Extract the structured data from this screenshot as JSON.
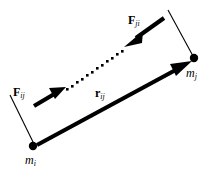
{
  "figure": {
    "background_color": "#ffffff",
    "stroke_color": "#000000",
    "width": 212,
    "height": 171,
    "labels": {
      "force_ji": {
        "base": "F",
        "subscript": "ji",
        "bold": true,
        "italic_subscript": true
      },
      "force_ij": {
        "base": "F",
        "subscript": "ij",
        "bold": true,
        "italic_subscript": true
      },
      "separation_r": {
        "base": "r",
        "subscript": "ij",
        "bold": true,
        "italic_subscript": true
      },
      "mass_j": {
        "base": "m",
        "subscript": "j",
        "bold": false,
        "italic_subscript": true
      },
      "mass_i": {
        "base": "m",
        "subscript": "i",
        "bold": false,
        "italic_subscript": true
      }
    },
    "geometry": {
      "point_mass_i": {
        "x": 33,
        "y": 146,
        "radius": 4
      },
      "point_mass_j": {
        "x": 194,
        "y": 58,
        "radius": 4
      },
      "vector_r_ij": {
        "from_x": 36,
        "from_y": 146,
        "to_x": 190,
        "to_y": 62,
        "style": "solid-thick-arrow"
      },
      "vector_F_ij": {
        "from_x": 33,
        "from_y": 105,
        "to_x": 65,
        "to_y": 87,
        "style": "solid-thick-arrow"
      },
      "vector_F_ji": {
        "from_x": 163,
        "from_y": 19,
        "to_x": 124,
        "to_y": 46,
        "style": "solid-thick-arrow"
      },
      "dotted_line": {
        "from_x": 66,
        "from_y": 90,
        "to_x": 125,
        "to_y": 48,
        "style": "square-dots"
      },
      "tick_mass_i": {
        "from_x": 10,
        "from_y": 95,
        "to_x": 34,
        "to_y": 144
      },
      "tick_mass_j": {
        "from_x": 168,
        "from_y": 10,
        "to_x": 193,
        "to_y": 56
      }
    }
  }
}
